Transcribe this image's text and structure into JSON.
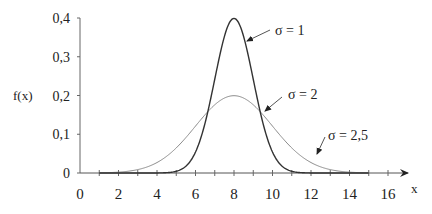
{
  "chart_data": {
    "type": "line",
    "title": "",
    "xlabel": "x",
    "ylabel": "f(x)",
    "xlim": [
      0,
      17
    ],
    "ylim": [
      0,
      0.4
    ],
    "grid": false,
    "x_ticks": [
      0,
      2,
      4,
      6,
      8,
      10,
      12,
      14,
      16
    ],
    "x_tick_labels": [
      "0",
      "2",
      "4",
      "6",
      "8",
      "10",
      "12",
      "14",
      "16"
    ],
    "y_ticks": [
      0,
      0.1,
      0.2,
      0.3,
      0.4
    ],
    "y_tick_labels": [
      "0",
      "0,1",
      "0,2",
      "0,3",
      "0,4"
    ],
    "series": [
      {
        "name": "σ = 1",
        "mean": 8,
        "sigma": 1,
        "color": "#333333",
        "x": [
          5,
          6,
          7,
          8,
          9,
          10,
          11
        ],
        "values": [
          0.004,
          0.054,
          0.242,
          0.399,
          0.242,
          0.054,
          0.004
        ]
      },
      {
        "name": "σ = 2",
        "mean": 8,
        "sigma": 2,
        "color": "#777777",
        "x": [
          1,
          2,
          4,
          6,
          8,
          10,
          12,
          14,
          15
        ],
        "values": [
          0.0004,
          0.002,
          0.027,
          0.121,
          0.199,
          0.121,
          0.027,
          0.002,
          0.0004
        ]
      }
    ],
    "annotations": [
      {
        "label": "σ = 1",
        "points_to": "σ = 1 curve, right flank"
      },
      {
        "label": "σ = 2",
        "points_to": "σ = 2 curve near x≈9.5"
      },
      {
        "label": "σ = 2,5",
        "points_to": "lighter curve tail near x≈12"
      }
    ]
  },
  "labels": {
    "ylabel": "f(x)",
    "xlabel": "x",
    "ann_s1": "σ = 1",
    "ann_s2": "σ = 2",
    "ann_s25": "σ = 2,5"
  }
}
